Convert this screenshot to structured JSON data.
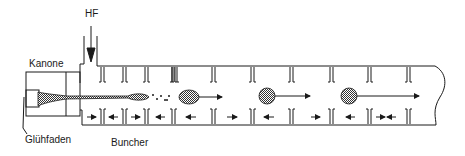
{
  "labels": {
    "hf": "HF",
    "kanone": "Kanone",
    "gluehfaden": "Glühfaden",
    "buncher": "Buncher"
  },
  "colors": {
    "line": "#1a1a1a",
    "fill_stipple": "#8a8a8a",
    "background": "#ffffff"
  },
  "diagram": {
    "type": "linear accelerator schematic",
    "components": [
      "HF input",
      "Kanone (electron gun)",
      "Glühfaden (filament)",
      "Buncher",
      "accelerating waveguide with iris diaphragms"
    ],
    "upper_field_arrows": [
      "right",
      "right",
      "right"
    ],
    "lower_field_arrows": [
      "right",
      "left",
      "right",
      "left",
      "left",
      "right",
      "left",
      "right",
      "left",
      "right",
      "left"
    ]
  }
}
